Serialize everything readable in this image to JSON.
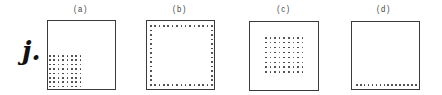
{
  "row_label": "j.",
  "panels": [
    {
      "id": "a",
      "label": "(a)",
      "box": {
        "x": 47,
        "y": 20,
        "w": 69,
        "h": 70
      },
      "dots": {
        "pattern": "grid",
        "x0": 49,
        "y0": 55,
        "dx": 4.4,
        "dy": 4.4,
        "cols": 8,
        "rows": 8
      }
    },
    {
      "id": "b",
      "label": "(b)",
      "box": {
        "x": 146,
        "y": 20,
        "w": 69,
        "h": 70
      },
      "dots": {
        "pattern": "perimeter",
        "x0": 150,
        "y0": 25,
        "x1": 211,
        "y1": 84,
        "count_h": 15,
        "count_v": 14
      }
    },
    {
      "id": "c",
      "label": "(c)",
      "box": {
        "x": 249,
        "y": 21,
        "w": 70,
        "h": 70
      },
      "dots": {
        "pattern": "grid",
        "x0": 265,
        "y0": 37,
        "dx": 4.6,
        "dy": 4.9,
        "cols": 9,
        "rows": 8
      }
    },
    {
      "id": "d",
      "label": "(d)",
      "box": {
        "x": 351,
        "y": 21,
        "w": 69,
        "h": 69
      },
      "dots": {
        "pattern": "row",
        "x0": 356,
        "y0": 84,
        "x1": 415,
        "count": 16
      }
    }
  ]
}
